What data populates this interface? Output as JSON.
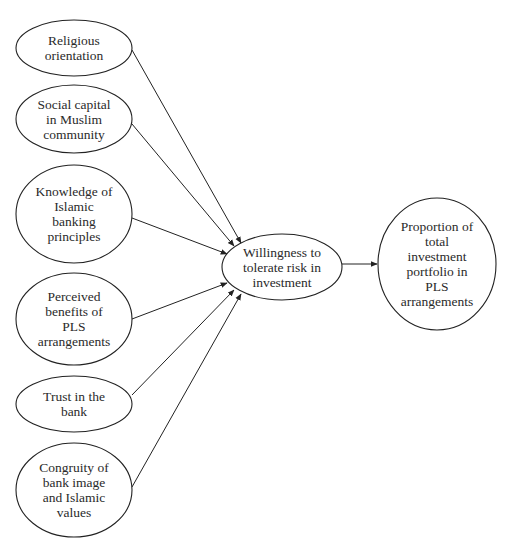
{
  "diagram": {
    "type": "path-model",
    "nodes": [
      {
        "id": "religious",
        "lines": [
          "Religious",
          "orientation"
        ],
        "cx": 74,
        "cy": 48,
        "rx": 58,
        "ry": 28
      },
      {
        "id": "social",
        "lines": [
          "Social capital",
          "in Muslim",
          "community"
        ],
        "cx": 74,
        "cy": 119,
        "rx": 58,
        "ry": 34
      },
      {
        "id": "knowledge",
        "lines": [
          "Knowledge of",
          "Islamic",
          "banking",
          "principles"
        ],
        "cx": 74,
        "cy": 214,
        "rx": 58,
        "ry": 49
      },
      {
        "id": "benefits",
        "lines": [
          "Perceived",
          "benefits of",
          "PLS",
          "arrangements"
        ],
        "cx": 74,
        "cy": 319,
        "rx": 58,
        "ry": 46
      },
      {
        "id": "trust",
        "lines": [
          "Trust in the",
          "bank"
        ],
        "cx": 74,
        "cy": 404,
        "rx": 58,
        "ry": 28
      },
      {
        "id": "congruity",
        "lines": [
          "Congruity of",
          "bank image",
          "and Islamic",
          "values"
        ],
        "cx": 74,
        "cy": 490,
        "rx": 58,
        "ry": 47
      },
      {
        "id": "willingness",
        "lines": [
          "Willingness to",
          "tolerate risk in",
          "investment"
        ],
        "cx": 282,
        "cy": 267,
        "rx": 60,
        "ry": 33
      },
      {
        "id": "proportion",
        "lines": [
          "Proportion of",
          "total",
          "investment",
          "portfolio in",
          "PLS",
          "arrangements"
        ],
        "cx": 437,
        "cy": 264,
        "rx": 59,
        "ry": 66
      }
    ],
    "edges": [
      {
        "from": "religious",
        "to": "willingness",
        "x1": 132,
        "y1": 50,
        "x2": 241,
        "y2": 243
      },
      {
        "from": "social",
        "to": "willingness",
        "x1": 132,
        "y1": 124,
        "x2": 234,
        "y2": 246
      },
      {
        "from": "knowledge",
        "to": "willingness",
        "x1": 132,
        "y1": 218,
        "x2": 227,
        "y2": 254
      },
      {
        "from": "benefits",
        "to": "willingness",
        "x1": 132,
        "y1": 319,
        "x2": 227,
        "y2": 283
      },
      {
        "from": "trust",
        "to": "willingness",
        "x1": 132,
        "y1": 395,
        "x2": 234,
        "y2": 290
      },
      {
        "from": "congruity",
        "to": "willingness",
        "x1": 132,
        "y1": 487,
        "x2": 241,
        "y2": 294
      },
      {
        "from": "willingness",
        "to": "proportion",
        "x1": 342,
        "y1": 264,
        "x2": 377,
        "y2": 264
      }
    ],
    "colors": {
      "stroke": "#222222",
      "text": "#2a2a2a",
      "background": "#ffffff"
    }
  }
}
